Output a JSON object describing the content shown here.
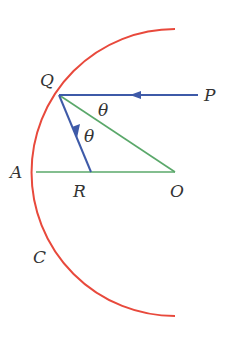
{
  "diagram": {
    "colors": {
      "mirror": "#e8493c",
      "ray": "#3e5aa8",
      "geometry": "#5aa86a",
      "label": "#333333"
    },
    "labels": {
      "Q": "Q",
      "P": "P",
      "A": "A",
      "R": "R",
      "O": "O",
      "C": "C",
      "theta1": "θ",
      "theta2": "θ"
    },
    "points": {
      "O": [
        175,
        172
      ],
      "Q": [
        59,
        95
      ],
      "A": [
        36,
        172
      ],
      "R": [
        91,
        172
      ],
      "P": [
        198,
        95
      ]
    }
  }
}
